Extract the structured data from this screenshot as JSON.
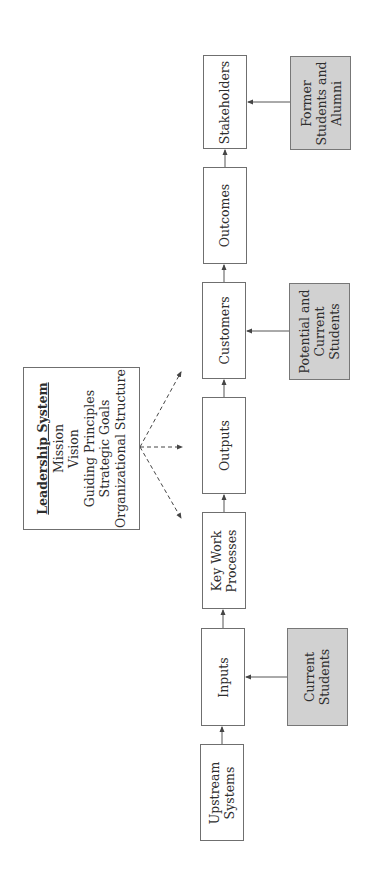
{
  "diagram": {
    "orientation": "rotated-90-ccw",
    "chain": [
      {
        "id": "upstream",
        "lines": [
          "Upstream",
          "Systems"
        ]
      },
      {
        "id": "inputs",
        "lines": [
          "Inputs"
        ]
      },
      {
        "id": "key-work",
        "lines": [
          "Key Work",
          "Processes"
        ]
      },
      {
        "id": "outputs",
        "lines": [
          "Outputs"
        ]
      },
      {
        "id": "customers",
        "lines": [
          "Customers"
        ]
      },
      {
        "id": "outcomes",
        "lines": [
          "Outcomes"
        ]
      },
      {
        "id": "stakeholders",
        "lines": [
          "Stakeholders"
        ]
      }
    ],
    "feeders": [
      {
        "id": "current-students",
        "target": "inputs",
        "lines": [
          "Current",
          "Students"
        ]
      },
      {
        "id": "potential-students",
        "target": "customers",
        "lines": [
          "Potential and",
          "Current",
          "Students"
        ]
      },
      {
        "id": "alumni",
        "target": "stakeholders",
        "lines": [
          "Former",
          "Students and",
          "Alumni"
        ]
      }
    ],
    "leadership": {
      "title": "Leadership System",
      "items": [
        "Mission",
        "Vision",
        "Guiding Principles",
        "Strategic Goals",
        "Organizational Structure"
      ],
      "targets": [
        "key-work",
        "outputs",
        "customers"
      ]
    },
    "colors": {
      "feeder_fill": "#d1d1d1",
      "border": "#6f6f6f",
      "line": "#555555"
    }
  }
}
